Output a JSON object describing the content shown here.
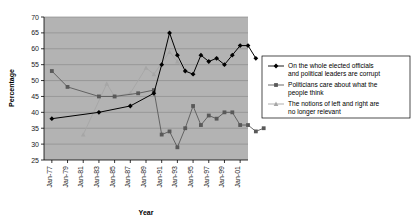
{
  "chart_data": {
    "type": "line",
    "title": "",
    "xlabel": "Year",
    "ylabel": "Percentage",
    "ylim": [
      25,
      70
    ],
    "ytick_step": 5,
    "yticks": [
      25,
      30,
      35,
      40,
      45,
      50,
      55,
      60,
      65,
      70
    ],
    "xticks": [
      "Jan-77",
      "Jan-79",
      "Jan-81",
      "Jan-83",
      "Jan-85",
      "Jan-87",
      "Jan-89",
      "Jan-91",
      "Jan-93",
      "Jan-95",
      "Jan-97",
      "Jan-99",
      "Jan-01"
    ],
    "x": [
      1977,
      1978,
      1979,
      1980,
      1981,
      1982,
      1983,
      1984,
      1985,
      1986,
      1987,
      1988,
      1989,
      1990,
      1991,
      1992,
      1993,
      1994,
      1995,
      1996,
      1997,
      1998,
      1999,
      2000,
      2001,
      2002
    ],
    "grid": true,
    "grid_axis": "y",
    "plot_background": "#b3b3b3",
    "legend_position": "right-outside",
    "series": [
      {
        "name": "On the whole elected officials and political leaders are corrupt",
        "color": "#000000",
        "marker": "diamond",
        "points": [
          {
            "x": 1977,
            "y": 38
          },
          {
            "x": 1983,
            "y": 40
          },
          {
            "x": 1987,
            "y": 42
          },
          {
            "x": 1990,
            "y": 46
          },
          {
            "x": 1991,
            "y": 55
          },
          {
            "x": 1992,
            "y": 65
          },
          {
            "x": 1993,
            "y": 58
          },
          {
            "x": 1994,
            "y": 53
          },
          {
            "x": 1995,
            "y": 52
          },
          {
            "x": 1996,
            "y": 58
          },
          {
            "x": 1997,
            "y": 56
          },
          {
            "x": 1998,
            "y": 57
          },
          {
            "x": 1999,
            "y": 55
          },
          {
            "x": 2000,
            "y": 58
          },
          {
            "x": 2001,
            "y": 61
          },
          {
            "x": 2002,
            "y": 61
          },
          {
            "x": 2003,
            "y": 57
          }
        ]
      },
      {
        "name": "Politicians care about what the people think",
        "color": "#595959",
        "marker": "square",
        "points": [
          {
            "x": 1977,
            "y": 53
          },
          {
            "x": 1979,
            "y": 48
          },
          {
            "x": 1983,
            "y": 45
          },
          {
            "x": 1985,
            "y": 45
          },
          {
            "x": 1988,
            "y": 46
          },
          {
            "x": 1990,
            "y": 47
          },
          {
            "x": 1991,
            "y": 33
          },
          {
            "x": 1992,
            "y": 34
          },
          {
            "x": 1993,
            "y": 29
          },
          {
            "x": 1994,
            "y": 35
          },
          {
            "x": 1995,
            "y": 42
          },
          {
            "x": 1996,
            "y": 36
          },
          {
            "x": 1997,
            "y": 39
          },
          {
            "x": 1998,
            "y": 38
          },
          {
            "x": 1999,
            "y": 40
          },
          {
            "x": 2000,
            "y": 40
          },
          {
            "x": 2001,
            "y": 36
          },
          {
            "x": 2002,
            "y": 36
          },
          {
            "x": 2003,
            "y": 34
          },
          {
            "x": 2004,
            "y": 35
          }
        ]
      },
      {
        "name": "The notions of left and right are no longer relevant",
        "color": "#a6a6a6",
        "marker": "triangle",
        "points": [
          {
            "x": 1981,
            "y": 33
          },
          {
            "x": 1984,
            "y": 49
          },
          {
            "x": 1985,
            "y": 45
          },
          {
            "x": 1987,
            "y": 46
          },
          {
            "x": 1989,
            "y": 54
          },
          {
            "x": 1990,
            "y": 52
          },
          {
            "x": 1992,
            "y": 59
          },
          {
            "x": 1993,
            "y": 56
          },
          {
            "x": 1994,
            "y": 53
          }
        ]
      }
    ]
  },
  "legend": {
    "items": [
      {
        "marker": "diamond",
        "color": "#000000",
        "line1": "On the whole elected officials",
        "line2": "and political leaders are corrupt"
      },
      {
        "marker": "square",
        "color": "#595959",
        "line1": "Politicians care about what the",
        "line2": "people think"
      },
      {
        "marker": "triangle",
        "color": "#a6a6a6",
        "line1": "The notions of left and right are",
        "line2": "no longer relevant"
      }
    ]
  },
  "axes": {
    "ylabel": "Percentage",
    "xlabel": "Year",
    "yticks": [
      "70",
      "65",
      "60",
      "55",
      "50",
      "45",
      "40",
      "35",
      "30",
      "25"
    ],
    "xticks": [
      "Jan-77",
      "Jan-79",
      "Jan-81",
      "Jan-83",
      "Jan-85",
      "Jan-87",
      "Jan-89",
      "Jan-91",
      "Jan-93",
      "Jan-95",
      "Jan-97",
      "Jan-99",
      "Jan-01"
    ]
  }
}
